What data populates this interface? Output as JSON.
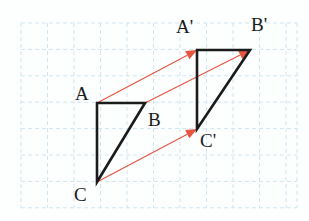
{
  "figure": {
    "canvas": {
      "width": 309,
      "height": 221,
      "background": "#fdfefe"
    },
    "grid": {
      "color": "#cfe6f0",
      "style": "dashed",
      "cell_width": 26.5,
      "cell_height": 26.4,
      "x_start": 21,
      "x_end": 297,
      "y_start": 23,
      "y_end": 208,
      "columns": 11,
      "rows": 7,
      "x_lines": [
        21,
        47.5,
        74,
        100.5,
        127,
        153.5,
        180,
        206.5,
        233,
        259.5,
        286,
        297
      ],
      "y_lines": [
        23,
        49.4,
        75.8,
        102.2,
        128.6,
        155,
        181.4,
        207.8
      ]
    },
    "shapes": {
      "preimage": {
        "name": "triangle ABC",
        "stroke": "#1b1b1b",
        "stroke_width": 2.6,
        "points": "97,103 145,103 97,182"
      },
      "image": {
        "name": "triangle A'B'C'",
        "stroke": "#1b1b1b",
        "stroke_width": 2.6,
        "points": "197,50 250,50 197,129"
      }
    },
    "vectors": {
      "color": "#e8543f",
      "stroke_width": 1.1,
      "arrow_fill": "#e8543f",
      "items": [
        {
          "name": "vector-A-to-Aprime",
          "from_label": "A",
          "to_label": "A'",
          "x1": 97,
          "y1": 103,
          "x2": 197,
          "y2": 50
        },
        {
          "name": "vector-B-to-Bprime",
          "from_label": "B",
          "to_label": "B'",
          "x1": 145,
          "y1": 103,
          "x2": 250,
          "y2": 50
        },
        {
          "name": "vector-C-to-Cprime",
          "from_label": "C",
          "to_label": "C'",
          "x1": 97,
          "y1": 182,
          "x2": 197,
          "y2": 129
        }
      ]
    },
    "labels": [
      {
        "name": "vertex-label-A",
        "text": "A",
        "x": 75,
        "y": 84
      },
      {
        "name": "vertex-label-B",
        "text": "B",
        "x": 148,
        "y": 110
      },
      {
        "name": "vertex-label-C",
        "text": "C",
        "x": 74,
        "y": 185
      },
      {
        "name": "vertex-label-A-prime",
        "text": "A'",
        "x": 176,
        "y": 17
      },
      {
        "name": "vertex-label-B-prime",
        "text": "B'",
        "x": 251,
        "y": 15
      },
      {
        "name": "vertex-label-C-prime",
        "text": "C'",
        "x": 200,
        "y": 131
      }
    ]
  }
}
